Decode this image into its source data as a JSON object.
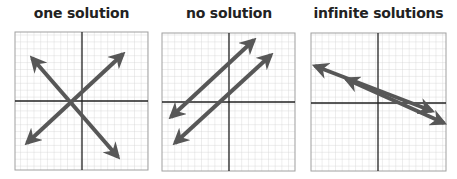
{
  "colors": {
    "grid": "#d0d0d0",
    "axis": "#222222",
    "arrow": "#575757",
    "border": "#9a9a9a",
    "title": "#222222"
  },
  "panels": [
    {
      "title": "one solution",
      "relationship": "intersecting lines",
      "lines": [
        {
          "x1": 27,
          "y1": 143,
          "x2": 123,
          "y2": 54
        },
        {
          "x1": 32,
          "y1": 58,
          "x2": 118,
          "y2": 157
        }
      ]
    },
    {
      "title": "no solution",
      "relationship": "parallel lines",
      "lines": [
        {
          "x1": 171,
          "y1": 117,
          "x2": 254,
          "y2": 40
        },
        {
          "x1": 175,
          "y1": 143,
          "x2": 271,
          "y2": 55
        }
      ]
    },
    {
      "title": "infinite solutions",
      "relationship": "coincident lines",
      "lines": [
        {
          "x1": 315,
          "y1": 66,
          "x2": 432,
          "y2": 111
        },
        {
          "x1": 346,
          "y1": 79,
          "x2": 444,
          "y2": 123
        }
      ]
    }
  ]
}
